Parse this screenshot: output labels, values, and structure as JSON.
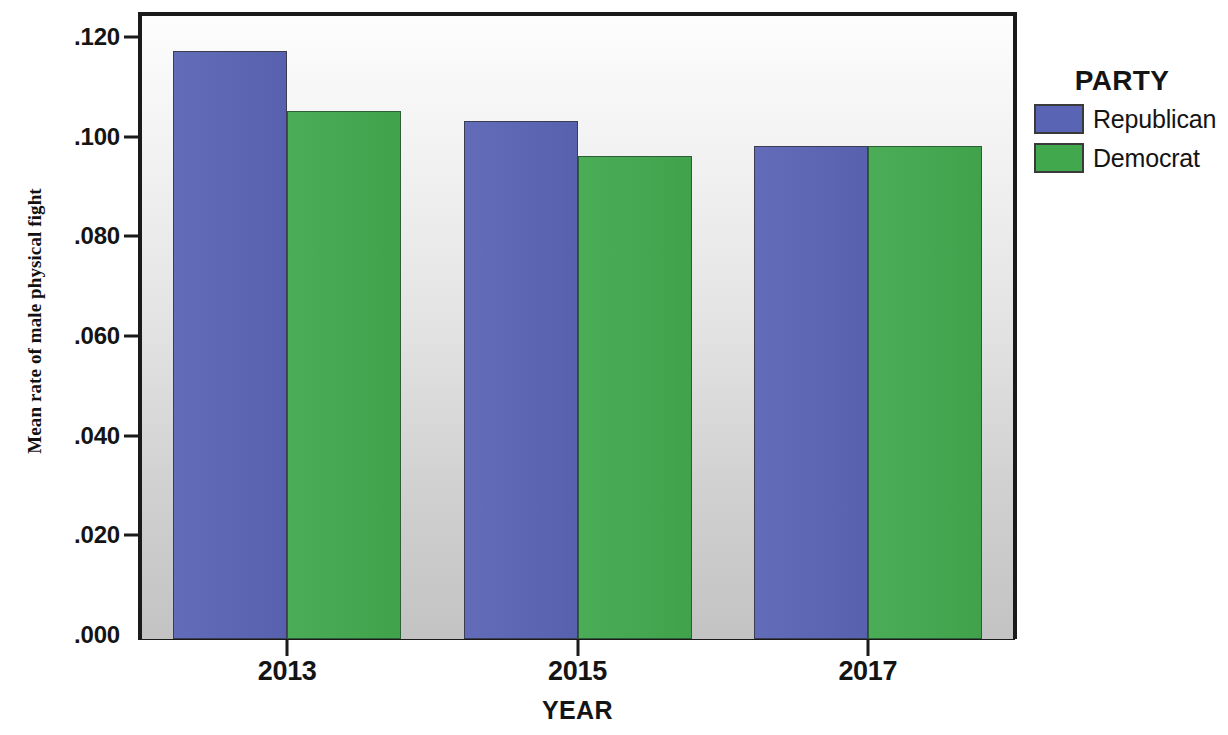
{
  "chart_data": {
    "type": "bar",
    "title": "",
    "xlabel": "YEAR",
    "ylabel": "Mean rate of male physical fight",
    "categories": [
      "2013",
      "2015",
      "2017"
    ],
    "series": [
      {
        "name": "Republican",
        "color": "#5a64b4",
        "values": [
          0.118,
          0.104,
          0.099
        ]
      },
      {
        "name": "Democrat",
        "color": "#42a84e",
        "values": [
          0.106,
          0.097,
          0.099
        ]
      }
    ],
    "ylim": [
      0.0,
      0.125
    ],
    "ytick_values": [
      0.0,
      0.02,
      0.04,
      0.06,
      0.08,
      0.1,
      0.12
    ],
    "ytick_labels": [
      ".000",
      ".020",
      ".040",
      ".060",
      ".080",
      ".100",
      ".120"
    ],
    "grid": false,
    "legend": {
      "title": "PARTY",
      "position": "right",
      "entries": [
        {
          "label": "Republican",
          "color": "#5a64b4"
        },
        {
          "label": "Democrat",
          "color": "#42a84e"
        }
      ]
    }
  },
  "colors": {
    "republican": "#5a64b4",
    "democrat": "#42a84e",
    "axis": "#1a1a1a",
    "text": "#141414",
    "plot_background_top": "#fdfdfd",
    "plot_background_bottom": "#c3c3c3"
  }
}
